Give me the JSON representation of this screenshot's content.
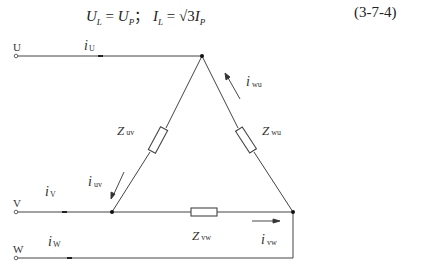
{
  "formula": {
    "lhs1": "U",
    "lhs1_sub": "L",
    "eq1": " = ",
    "rhs1": "U",
    "rhs1_sub": "P",
    "sep": "； ",
    "lhs2": "I",
    "lhs2_sub": "L",
    "eq2": " = √3",
    "rhs2": "I",
    "rhs2_sub": "P",
    "number": "(3-7-4)"
  },
  "terminals": [
    {
      "label": "U"
    },
    {
      "label": "V"
    },
    {
      "label": "W"
    }
  ],
  "currents": {
    "iU": {
      "symbol": "i",
      "sub": "U"
    },
    "iV": {
      "symbol": "i",
      "sub": "V"
    },
    "iW": {
      "symbol": "i",
      "sub": "W"
    },
    "iuv": {
      "symbol": "i",
      "sub": "uv"
    },
    "iwu": {
      "symbol": "i",
      "sub": "wu"
    },
    "ivw": {
      "symbol": "i",
      "sub": "vw"
    }
  },
  "impedances": {
    "Zuv": {
      "symbol": "Z",
      "sub": "uv"
    },
    "Zwu": {
      "symbol": "Z",
      "sub": "wu"
    },
    "Zvw": {
      "symbol": "Z",
      "sub": "vw"
    }
  }
}
